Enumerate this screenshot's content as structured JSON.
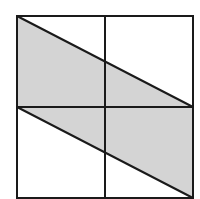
{
  "diagram": {
    "colors": {
      "background": "#ffffff",
      "stroke": "#1a1a1a",
      "shade": "#d4d4d4"
    },
    "square": {
      "x1": 17,
      "y1": 16,
      "x2": 193,
      "y2": 198
    },
    "midlines": {
      "x": 105,
      "y": 107
    },
    "parallelogram": [
      [
        17,
        16
      ],
      [
        193,
        107
      ],
      [
        193,
        198
      ],
      [
        17,
        107
      ]
    ]
  }
}
